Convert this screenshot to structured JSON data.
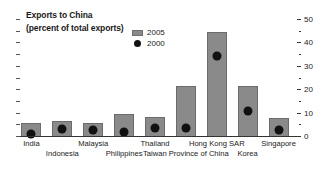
{
  "title": {
    "line1": "Exports to China",
    "line2": "(percent of total exports)"
  },
  "legend": {
    "items": [
      {
        "label": "2005",
        "marker": "square",
        "color": "#8a8a8a"
      },
      {
        "label": "2000",
        "marker": "circle",
        "color": "#111111"
      }
    ]
  },
  "axis": {
    "tick_labels": [
      "0",
      "10",
      "20",
      "30",
      "40",
      "50"
    ],
    "minor_tick_values": [
      5,
      15,
      25,
      35,
      45
    ],
    "min": 0,
    "max": 50,
    "position": "right"
  },
  "chart_data": {
    "type": "bar",
    "title": "Exports to China (percent of total exports)",
    "xlabel": "",
    "ylabel": "percent of total exports",
    "ylim": [
      0,
      50
    ],
    "grid": false,
    "legend_position": "top-center",
    "categories": [
      "India",
      "Indonesia",
      "Malaysia",
      "Philippines",
      "Thailand",
      "Taiwan Province of China",
      "Hong Kong SAR",
      "Korea",
      "Singapore"
    ],
    "series": [
      {
        "name": "2005",
        "type": "bar",
        "color": "#8a8a8a",
        "values": [
          6,
          7,
          6,
          10,
          8.5,
          22,
          45,
          22,
          8
        ]
      },
      {
        "name": "2000",
        "type": "point",
        "color": "#111111",
        "values": [
          1.5,
          3.5,
          3,
          2,
          4,
          4,
          34.5,
          11,
          3
        ]
      }
    ]
  }
}
